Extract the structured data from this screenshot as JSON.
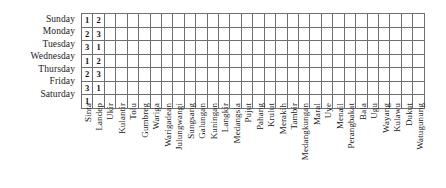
{
  "figure": {
    "type": "table",
    "grid_line_color": "#6f6f6f",
    "text_color": "#1a1a1a",
    "cell_background": "#ffffff"
  },
  "rows": [
    {
      "label": "Sunday"
    },
    {
      "label": "Monday"
    },
    {
      "label": "Tuesday"
    },
    {
      "label": "Wednesday"
    },
    {
      "label": "Thursday"
    },
    {
      "label": "Friday"
    },
    {
      "label": "Saturday"
    }
  ],
  "columns": [
    "Sinta",
    "Landep",
    "Ukir",
    "Kulantir",
    "Tolu",
    "Gumbreg",
    "Wariga",
    "Warigadean",
    "Julungwangi",
    "Sungsang",
    "Galungan",
    "Kuningan",
    "Langkir",
    "Medangsia",
    "Pujut",
    "Pahang",
    "Krulut",
    "Merakih",
    "Tambir",
    "Medangkungan",
    "Maral",
    "Uye",
    "Menail",
    "Perangbakat",
    "Bala",
    "Ugu",
    "Wayang",
    "Kulawu",
    "Dukut",
    "Watugunung"
  ],
  "cells": [
    [
      "1",
      "2",
      "",
      "",
      "",
      "",
      "",
      "",
      "",
      "",
      "",
      "",
      "",
      "",
      "",
      "",
      "",
      "",
      "",
      "",
      "",
      "",
      "",
      "",
      "",
      "",
      "",
      "",
      "",
      ""
    ],
    [
      "2",
      "3",
      "",
      "",
      "",
      "",
      "",
      "",
      "",
      "",
      "",
      "",
      "",
      "",
      "",
      "",
      "",
      "",
      "",
      "",
      "",
      "",
      "",
      "",
      "",
      "",
      "",
      "",
      "",
      ""
    ],
    [
      "3",
      "1",
      "",
      "",
      "",
      "",
      "",
      "",
      "",
      "",
      "",
      "",
      "",
      "",
      "",
      "",
      "",
      "",
      "",
      "",
      "",
      "",
      "",
      "",
      "",
      "",
      "",
      "",
      "",
      ""
    ],
    [
      "1",
      "2",
      "",
      "",
      "",
      "",
      "",
      "",
      "",
      "",
      "",
      "",
      "",
      "",
      "",
      "",
      "",
      "",
      "",
      "",
      "",
      "",
      "",
      "",
      "",
      "",
      "",
      "",
      "",
      ""
    ],
    [
      "2",
      "3",
      "",
      "",
      "",
      "",
      "",
      "",
      "",
      "",
      "",
      "",
      "",
      "",
      "",
      "",
      "",
      "",
      "",
      "",
      "",
      "",
      "",
      "",
      "",
      "",
      "",
      "",
      "",
      ""
    ],
    [
      "3",
      "1",
      "",
      "",
      "",
      "",
      "",
      "",
      "",
      "",
      "",
      "",
      "",
      "",
      "",
      "",
      "",
      "",
      "",
      "",
      "",
      "",
      "",
      "",
      "",
      "",
      "",
      "",
      "",
      ""
    ],
    [
      "1",
      "",
      "",
      "",
      "",
      "",
      "",
      "",
      "",
      "",
      "",
      "",
      "",
      "",
      "",
      "",
      "",
      "",
      "",
      "",
      "",
      "",
      "",
      "",
      "",
      "",
      "",
      "",
      "",
      ""
    ]
  ]
}
